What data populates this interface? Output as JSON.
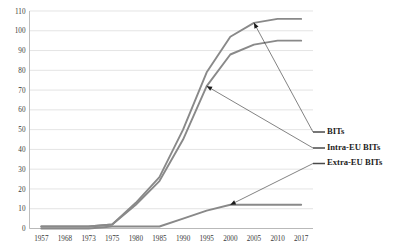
{
  "chart_data": {
    "type": "line",
    "title": "",
    "xlabel": "",
    "ylabel": "",
    "ylim": [
      0,
      110
    ],
    "ytick_step": 10,
    "grid": true,
    "legend_position": "right",
    "categories": [
      "1957",
      "1968",
      "1973",
      "1975",
      "1980",
      "1985",
      "1990",
      "1995",
      "2000",
      "2005",
      "2010",
      "2017"
    ],
    "yticks": [
      "0",
      "10",
      "20",
      "30",
      "40",
      "50",
      "60",
      "70",
      "80",
      "90",
      "100",
      "110"
    ],
    "series": [
      {
        "name": "BITs",
        "color": "#898989",
        "values": [
          1,
          1,
          1,
          2,
          13,
          26,
          50,
          79,
          97,
          104,
          106,
          106
        ]
      },
      {
        "name": "Intra-EU BITs",
        "color": "#898989",
        "values": [
          1,
          1,
          1,
          2,
          12,
          24,
          45,
          72,
          88,
          93,
          95,
          95
        ]
      },
      {
        "name": "Extra-EU BITs",
        "color": "#898989",
        "values": [
          0,
          0,
          0,
          1,
          1,
          1,
          5,
          9,
          12,
          12,
          12,
          12
        ]
      }
    ],
    "annotations": [
      {
        "label": "BITs",
        "target_category": "2005",
        "target_value": 104
      },
      {
        "label": "Intra-EU BITs",
        "target_category": "1995",
        "target_value": 72
      },
      {
        "label": "Extra-EU BITs",
        "target_category": "2000",
        "target_value": 12
      }
    ],
    "legend_entries": [
      {
        "label": "BITs"
      },
      {
        "label": "Intra-EU BITs"
      },
      {
        "label": "Extra-EU BITs"
      }
    ]
  }
}
